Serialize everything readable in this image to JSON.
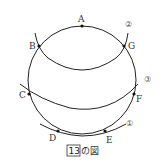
{
  "figure": {
    "caption_number": "13",
    "caption_text": "の図",
    "line_color": "#222222",
    "points": [
      {
        "id": "A",
        "label": "A"
      },
      {
        "id": "B",
        "label": "B"
      },
      {
        "id": "C",
        "label": "C"
      },
      {
        "id": "D",
        "label": "D"
      },
      {
        "id": "E",
        "label": "E"
      },
      {
        "id": "F",
        "label": "F"
      },
      {
        "id": "G",
        "label": "G"
      }
    ],
    "arcs": [
      {
        "id": "1",
        "label": "①",
        "through": [
          "D",
          "E"
        ]
      },
      {
        "id": "2",
        "label": "②",
        "through": [
          "B",
          "G"
        ]
      },
      {
        "id": "3",
        "label": "③",
        "through": [
          "C",
          "F"
        ]
      }
    ]
  }
}
